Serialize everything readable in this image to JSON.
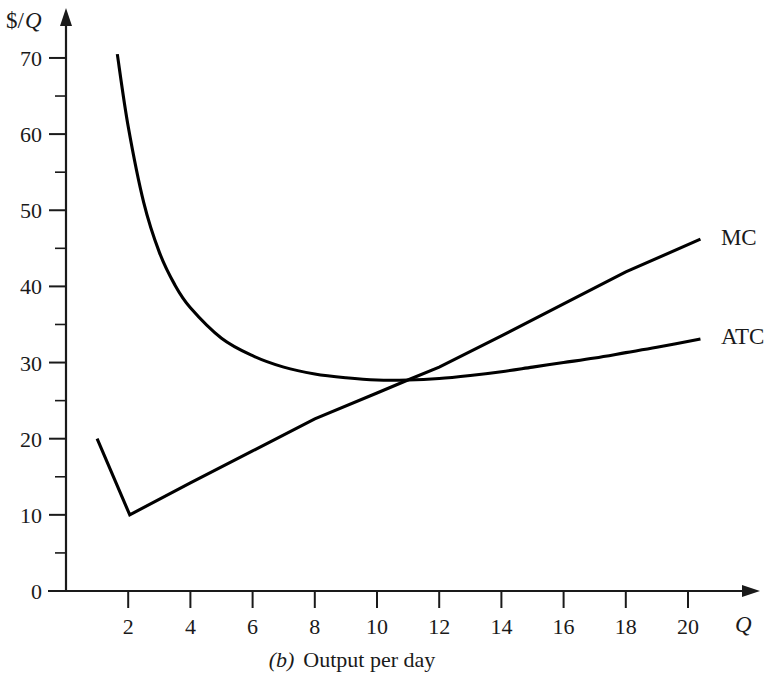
{
  "chart_data": {
    "type": "line",
    "title": "",
    "caption_prefix": "(b)",
    "caption_text": "Output per day",
    "xlabel": "Q",
    "ylabel": "$/Q",
    "ylabel_currency": "$/",
    "ylabel_variable": "Q",
    "xlim": [
      0,
      22
    ],
    "ylim": [
      0,
      75
    ],
    "grid": false,
    "legend_position": "right-of-curve-ends",
    "x_ticks": [
      2,
      4,
      6,
      8,
      10,
      12,
      14,
      16,
      18,
      20
    ],
    "x_tick_labels": [
      "2",
      "4",
      "6",
      "8",
      "10",
      "12",
      "14",
      "16",
      "18",
      "20"
    ],
    "x_minor_ticks": [
      1,
      3,
      5,
      7,
      9,
      11,
      13,
      15,
      17,
      19
    ],
    "y_ticks": [
      0,
      10,
      20,
      30,
      40,
      50,
      60,
      70
    ],
    "y_tick_labels": [
      "0",
      "10",
      "20",
      "30",
      "40",
      "50",
      "60",
      "70"
    ],
    "y_minor_ticks": [
      5,
      15,
      25,
      35,
      45,
      55,
      65
    ],
    "series": [
      {
        "name": "MC",
        "label": "MC",
        "color": "#000000",
        "label_x": 20.8,
        "label_y": 46.5,
        "points": [
          {
            "x": 1.0,
            "y": 20.0
          },
          {
            "x": 2.05,
            "y": 10.0
          },
          {
            "x": 4.0,
            "y": 14.2
          },
          {
            "x": 6.0,
            "y": 18.4
          },
          {
            "x": 8.0,
            "y": 22.6
          },
          {
            "x": 10.0,
            "y": 26.0
          },
          {
            "x": 11.05,
            "y": 27.8
          },
          {
            "x": 12.0,
            "y": 29.4
          },
          {
            "x": 14.0,
            "y": 33.5
          },
          {
            "x": 16.0,
            "y": 37.7
          },
          {
            "x": 18.0,
            "y": 41.9
          },
          {
            "x": 20.4,
            "y": 46.2
          }
        ]
      },
      {
        "name": "ATC",
        "label": "ATC",
        "color": "#000000",
        "label_x": 20.8,
        "label_y": 33.5,
        "points": [
          {
            "x": 1.65,
            "y": 70.5
          },
          {
            "x": 2.0,
            "y": 61.0
          },
          {
            "x": 2.5,
            "y": 51.0
          },
          {
            "x": 3.0,
            "y": 44.5
          },
          {
            "x": 3.5,
            "y": 40.2
          },
          {
            "x": 4.0,
            "y": 37.2
          },
          {
            "x": 5.0,
            "y": 33.2
          },
          {
            "x": 6.0,
            "y": 30.9
          },
          {
            "x": 7.0,
            "y": 29.4
          },
          {
            "x": 8.0,
            "y": 28.5
          },
          {
            "x": 9.0,
            "y": 28.0
          },
          {
            "x": 10.0,
            "y": 27.7
          },
          {
            "x": 11.0,
            "y": 27.7
          },
          {
            "x": 12.0,
            "y": 27.9
          },
          {
            "x": 13.0,
            "y": 28.3
          },
          {
            "x": 14.0,
            "y": 28.8
          },
          {
            "x": 15.0,
            "y": 29.4
          },
          {
            "x": 16.0,
            "y": 30.0
          },
          {
            "x": 17.0,
            "y": 30.6
          },
          {
            "x": 18.0,
            "y": 31.3
          },
          {
            "x": 19.0,
            "y": 32.0
          },
          {
            "x": 20.4,
            "y": 33.1
          }
        ]
      }
    ],
    "annotations": [
      {
        "name": "mc-atc-intersection",
        "x": 11.05,
        "y": 27.8,
        "note": "MC crosses ATC at ATC minimum"
      }
    ]
  }
}
